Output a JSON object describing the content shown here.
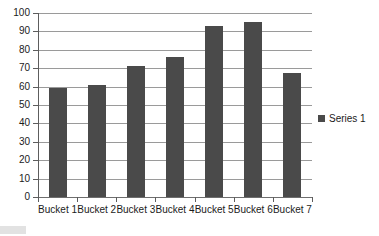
{
  "chart_data": {
    "type": "bar",
    "title": "",
    "subtitle": "",
    "xlabel": "",
    "ylabel": "",
    "categories": [
      "Bucket 1",
      "Bucket 2",
      "Bucket 3",
      "Bucket 4",
      "Bucket 5",
      "Bucket 6",
      "Bucket 7"
    ],
    "series": [
      {
        "name": "Series 1",
        "values": [
          59,
          61,
          71,
          76,
          93,
          95,
          67.5
        ],
        "color": "#4a4a4a"
      }
    ],
    "ylim": [
      0,
      100
    ],
    "y_ticks": [
      0,
      10,
      20,
      30,
      40,
      50,
      60,
      70,
      80,
      90,
      100
    ],
    "y_tick_labels": [
      "0",
      "10",
      "20",
      "30",
      "40",
      "50",
      "60",
      "70",
      "80",
      "90",
      "100"
    ],
    "grid": true,
    "grid_axis": "y",
    "legend": true,
    "legend_position": "right",
    "legend_entries": [
      "Series 1"
    ],
    "annotations": []
  },
  "legend": {
    "series_1_label": "Series 1",
    "swatch_name": "legend-color-swatch"
  },
  "colors": {
    "bar": "#4a4a4a",
    "gridline": "#9a9a9a",
    "axis": "#5d5d5d",
    "text": "#1b1b1b",
    "background": "#ffffff"
  }
}
